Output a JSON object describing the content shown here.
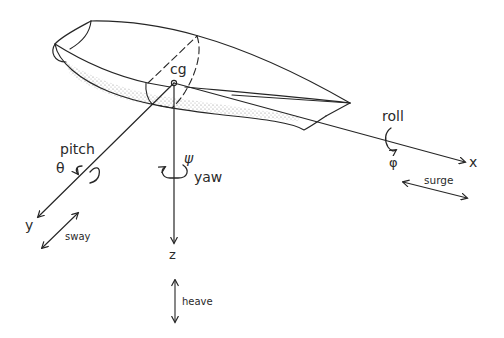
{
  "figure": {
    "type": "ship motion coordinate system",
    "origin_label": "cg",
    "axes": [
      {
        "id": "x",
        "label": "x",
        "motion": "surge",
        "rotation": "roll",
        "angle_symbol": "φ"
      },
      {
        "id": "y",
        "label": "y",
        "motion": "sway",
        "rotation": "pitch",
        "angle_symbol": "θ"
      },
      {
        "id": "z",
        "label": "z",
        "motion": "heave",
        "rotation": "yaw",
        "angle_symbol": "ψ"
      }
    ]
  },
  "labels": {
    "cg": "cg",
    "x": "x",
    "y": "y",
    "z": "z",
    "roll": "roll",
    "phi": "φ",
    "pitch": "pitch",
    "theta": "θ",
    "yaw": "yaw",
    "psi": "ψ",
    "surge": "surge",
    "sway": "sway",
    "heave": "heave"
  },
  "colors": {
    "ink": "#262626",
    "background": "#ffffff",
    "shading": "#9a9a9a"
  }
}
